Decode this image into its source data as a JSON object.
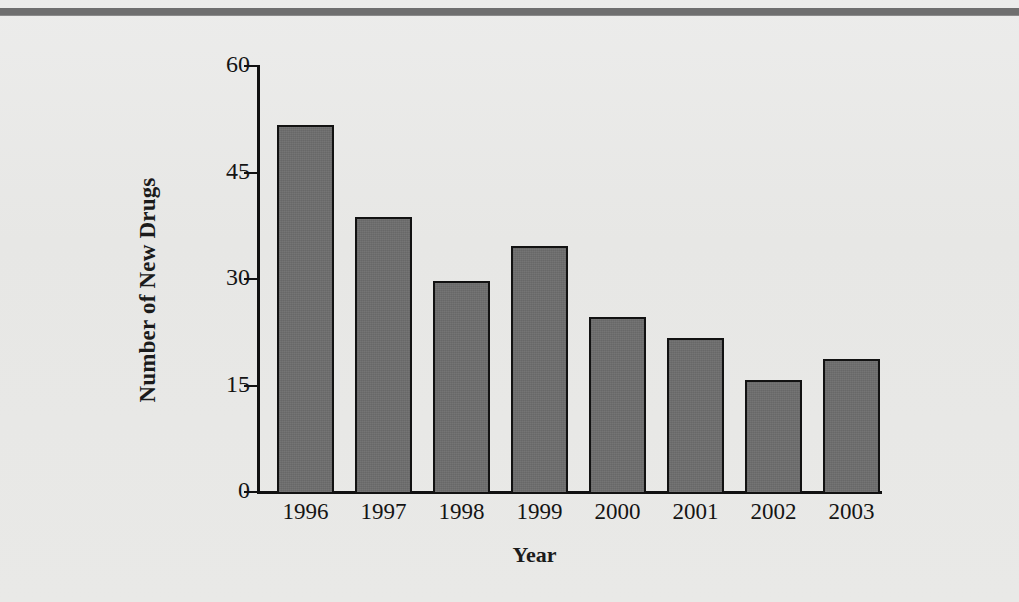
{
  "chart_data": {
    "type": "bar",
    "title": "",
    "xlabel": "Year",
    "ylabel": "Number of New Drugs",
    "categories": [
      "1996",
      "1997",
      "1998",
      "1999",
      "2000",
      "2001",
      "2002",
      "2003"
    ],
    "values": [
      52,
      39,
      30,
      35,
      25,
      22,
      16,
      19
    ],
    "ylim": [
      0,
      60
    ],
    "yticks": [
      0,
      15,
      30,
      45,
      60
    ],
    "ytick_labels": [
      "0",
      "15",
      "30",
      "45",
      "60"
    ],
    "grid": false,
    "legend": null,
    "series": [
      {
        "name": "Number of New Drugs",
        "values": [
          52,
          39,
          30,
          35,
          25,
          22,
          16,
          19
        ]
      }
    ],
    "colors": {
      "bar_fill": "#6d6d6d",
      "bar_stroke": "#121212",
      "axis": "#111111",
      "background": "#e9e9e7",
      "top_rule": "#6f6f6f",
      "text": "#141414"
    }
  }
}
